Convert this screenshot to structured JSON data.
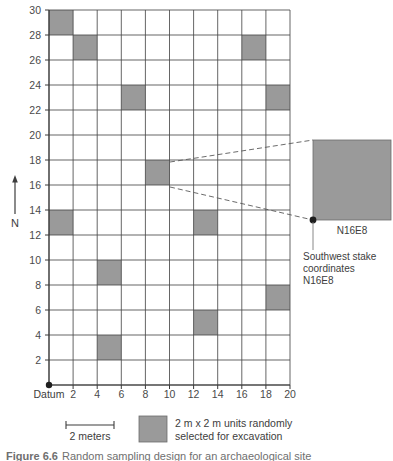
{
  "figure": {
    "caption_label": "Figure 6.6",
    "caption_text": "Random sampling design for an archaeological site"
  },
  "axes": {
    "x_label_origin": "Datum",
    "x_ticks": [
      "2",
      "4",
      "6",
      "8",
      "10",
      "12",
      "14",
      "16",
      "18",
      "20"
    ],
    "y_ticks": [
      "2",
      "4",
      "6",
      "8",
      "10",
      "12",
      "14",
      "16",
      "18",
      "20",
      "22",
      "24",
      "26",
      "28",
      "30"
    ],
    "x_min": 0,
    "x_max": 20,
    "y_min": 0,
    "y_max": 30,
    "cell_size": 2
  },
  "compass": {
    "label": "N"
  },
  "scalebar": {
    "label": "2 meters",
    "length_m": 2
  },
  "legend": {
    "swatch_color": "#9a9a9a",
    "line1": "2 m x 2 m units randomly",
    "line2": "selected for excavation"
  },
  "callout": {
    "unit_label": "N16E8",
    "stake_line1": "Southwest stake",
    "stake_line2": "coordinates",
    "stake_line3": "N16E8",
    "source_cell": {
      "east": 8,
      "north": 16
    }
  },
  "chart_data": {
    "type": "heatmap",
    "title": "Random sampling design for an archaeological site",
    "xlabel": "Datum",
    "ylabel": "",
    "xlim": [
      0,
      20
    ],
    "ylim": [
      0,
      30
    ],
    "grid": true,
    "cell_size": 2,
    "columns": 10,
    "rows": 15,
    "categories": [
      "0",
      "2",
      "4",
      "6",
      "8",
      "10",
      "12",
      "14",
      "16",
      "18"
    ],
    "selected_units": [
      {
        "east": 0,
        "north": 28,
        "label": "N28E0"
      },
      {
        "east": 2,
        "north": 26,
        "label": "N26E2"
      },
      {
        "east": 16,
        "north": 26,
        "label": "N26E16"
      },
      {
        "east": 6,
        "north": 22,
        "label": "N22E6"
      },
      {
        "east": 18,
        "north": 22,
        "label": "N22E18"
      },
      {
        "east": 8,
        "north": 16,
        "label": "N16E8"
      },
      {
        "east": 0,
        "north": 12,
        "label": "N12E0"
      },
      {
        "east": 12,
        "north": 12,
        "label": "N12E12"
      },
      {
        "east": 4,
        "north": 8,
        "label": "N8E4"
      },
      {
        "east": 18,
        "north": 6,
        "label": "N6E18"
      },
      {
        "east": 12,
        "north": 4,
        "label": "N4E12"
      },
      {
        "east": 4,
        "north": 2,
        "label": "N2E4"
      }
    ],
    "selected_count": 12,
    "total_units": 150,
    "legend_entries": [
      "2 m x 2 m units randomly selected for excavation"
    ]
  },
  "colors": {
    "fill": "#9a9a9a",
    "grid": "#4a4a4a",
    "axis": "#3a3a3a"
  }
}
